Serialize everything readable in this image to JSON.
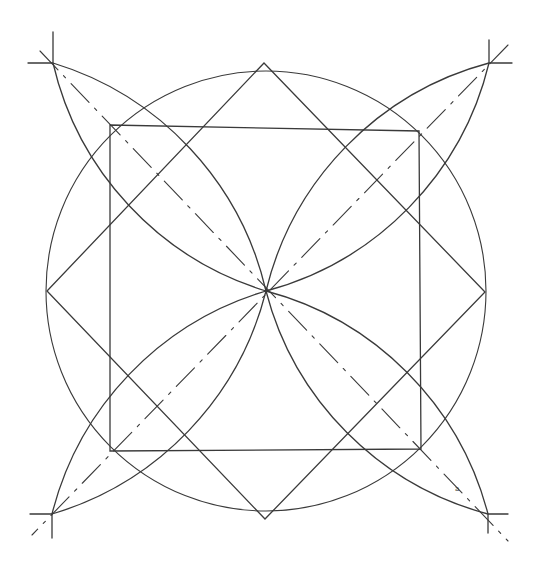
{
  "diagram": {
    "type": "geometric-construction",
    "stroke_color": "#3a3a3a",
    "background": "#ffffff",
    "center": [
      266,
      291
    ],
    "circle_radius": 220,
    "diamond": {
      "top": [
        264,
        63
      ],
      "right": [
        485,
        292
      ],
      "bottom": [
        265,
        519
      ],
      "left": [
        47,
        291
      ]
    },
    "square": {
      "tl": [
        110,
        125
      ],
      "tr": [
        419,
        131
      ],
      "br": [
        421,
        449
      ],
      "bl": [
        110,
        451
      ]
    },
    "corner_crosses": {
      "tl": [
        53,
        63
      ],
      "tr": [
        489,
        63
      ],
      "br": [
        488,
        514
      ],
      "bl": [
        52,
        514
      ]
    },
    "annotation": "a"
  }
}
